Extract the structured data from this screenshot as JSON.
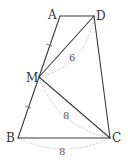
{
  "figure": {
    "type": "geometry",
    "vertices": {
      "A": {
        "label": "A",
        "x": 60,
        "y": 16
      },
      "D": {
        "label": "D",
        "x": 94,
        "y": 16
      },
      "M": {
        "label": "M",
        "x": 39,
        "y": 77
      },
      "B": {
        "label": "B",
        "x": 18,
        "y": 138
      },
      "C": {
        "label": "C",
        "x": 110,
        "y": 138
      }
    },
    "segments": [
      {
        "from": "A",
        "to": "D"
      },
      {
        "from": "D",
        "to": "C"
      },
      {
        "from": "C",
        "to": "B"
      },
      {
        "from": "B",
        "to": "M"
      },
      {
        "from": "M",
        "to": "A"
      },
      {
        "from": "M",
        "to": "D"
      },
      {
        "from": "M",
        "to": "C"
      }
    ],
    "equal_marks": [
      {
        "segment": "AM",
        "marks": 1
      },
      {
        "segment": "MB",
        "marks": 1
      }
    ],
    "measurements": [
      {
        "segment": "MD",
        "value": "6"
      },
      {
        "segment": "MC",
        "value": "8"
      },
      {
        "segment": "BC",
        "value": "8"
      }
    ]
  },
  "labels": {
    "A": "A",
    "D": "D",
    "M": "M",
    "B": "B",
    "C": "C",
    "md_length": "6",
    "mc_length": "8",
    "bc_length": "8"
  }
}
